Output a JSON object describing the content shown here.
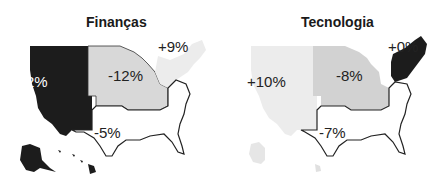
{
  "maps": [
    {
      "title": "Finanças",
      "regions": {
        "west": {
          "label": "-2%",
          "value": -2,
          "color": "#1c1c1c"
        },
        "midwest": {
          "label": "-12%",
          "value": -12,
          "color": "#d8d8d8"
        },
        "northeast": {
          "label": "+9%",
          "value": 9,
          "color": "#ececec"
        },
        "south": {
          "label": "-5%",
          "value": -5,
          "color": "#ffffff"
        }
      }
    },
    {
      "title": "Tecnologia",
      "regions": {
        "west": {
          "label": "+10%",
          "value": 10,
          "color": "#ececec"
        },
        "midwest": {
          "label": "-8%",
          "value": -8,
          "color": "#d2d2d2"
        },
        "northeast": {
          "label": "+0%",
          "value": 0,
          "color": "#1c1c1c"
        },
        "south": {
          "label": "-7%",
          "value": -7,
          "color": "#ffffff"
        }
      }
    }
  ]
}
